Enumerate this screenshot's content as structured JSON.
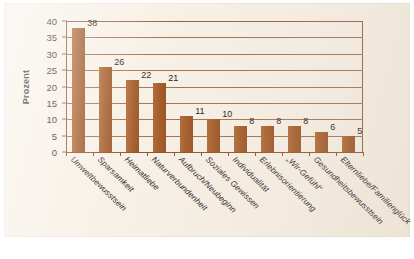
{
  "chart_data": {
    "type": "bar",
    "title": "",
    "xlabel": "",
    "ylabel": "Prozent",
    "ylim": [
      0,
      40
    ],
    "yticks": [
      0,
      5,
      10,
      15,
      20,
      25,
      30,
      35,
      40
    ],
    "grid": true,
    "legend": "none",
    "orientation": "vertical",
    "bar_color": "#a9612f",
    "background_color": "#f7f0e6",
    "axis_color": "#8d5630",
    "categories": [
      "Umweltbewusstsein",
      "Sparsamkeit",
      "Heimatliebe",
      "Naturverbundenheit",
      "Aufbruch/Neubeginn",
      "Soziales Gewissen",
      "Individualität",
      "Erlebnisorientierung",
      "„Wir-Gefühl“",
      "Gesundheitsbewusstsein",
      "Elternliebe/Familienglück"
    ],
    "values": [
      38,
      26,
      22,
      21,
      11,
      10,
      8,
      8,
      8,
      6,
      5
    ],
    "value_labels": [
      "38",
      "26",
      "22",
      "21",
      "11",
      "10",
      "8",
      "8",
      "8",
      "6",
      "5"
    ]
  }
}
